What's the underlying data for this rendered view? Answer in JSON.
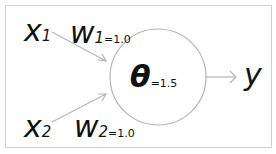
{
  "diagram": {
    "type": "perceptron",
    "inputs": [
      {
        "symbol": "x",
        "subscript": "1",
        "weight_symbol": "w",
        "weight_subscript": "1",
        "weight_value": "=1.0"
      },
      {
        "symbol": "x",
        "subscript": "2",
        "weight_symbol": "w",
        "weight_subscript": "2",
        "weight_value": "=1.0"
      }
    ],
    "neuron": {
      "threshold_symbol": "θ",
      "threshold_value": "=1.5"
    },
    "output": {
      "symbol": "y"
    },
    "colors": {
      "lines": "#b4b4b4",
      "text": "#111111",
      "frame": "#cfcfcf"
    }
  }
}
